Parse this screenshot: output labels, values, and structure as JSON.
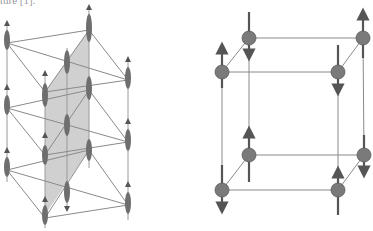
{
  "caption_fragment": "ture [1].",
  "figure_left": {
    "description": "Layered lattice with spin chains and shaded plane",
    "colors": {
      "line": "#8a8a8a",
      "atom": "#6e6e6e",
      "plane": "#bdbdbd"
    }
  },
  "figure_right": {
    "description": "Cubic unit cell with alternating spin arrows",
    "colors": {
      "line": "#8a8a8a",
      "atom": "#7a7a7a",
      "arrow": "#555555"
    }
  }
}
